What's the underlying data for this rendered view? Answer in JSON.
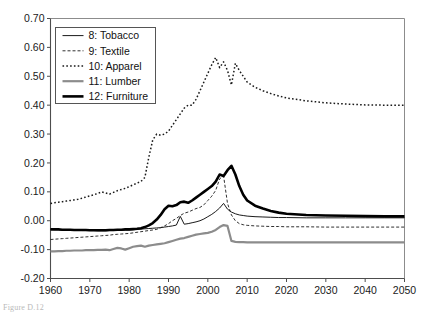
{
  "caption": "Figure D.12",
  "chart_data": {
    "type": "line",
    "title": "",
    "subtitle": "",
    "xlabel": "",
    "ylabel": "",
    "xlim": [
      1960,
      2050
    ],
    "ylim": [
      -0.2,
      0.7
    ],
    "grid": false,
    "legend_position": "top-left",
    "x_ticks": [
      1960,
      1970,
      1980,
      1990,
      2000,
      2010,
      2020,
      2030,
      2040,
      2050
    ],
    "x_tick_labels": [
      "1960",
      "1970",
      "1980",
      "1990",
      "2000",
      "2010",
      "2020",
      "2030",
      "2040",
      "2050"
    ],
    "y_ticks": [
      -0.2,
      -0.1,
      0.0,
      0.1,
      0.2,
      0.3,
      0.4,
      0.5,
      0.6,
      0.7
    ],
    "y_tick_labels": [
      "-0.20",
      "-0.10",
      "0.00",
      "0.10",
      "0.20",
      "0.30",
      "0.40",
      "0.50",
      "0.60",
      "0.70"
    ],
    "x": [
      1960,
      1961,
      1962,
      1963,
      1964,
      1965,
      1966,
      1967,
      1968,
      1969,
      1970,
      1971,
      1972,
      1973,
      1974,
      1975,
      1976,
      1977,
      1978,
      1979,
      1980,
      1981,
      1982,
      1983,
      1984,
      1985,
      1986,
      1987,
      1988,
      1989,
      1990,
      1991,
      1992,
      1993,
      1994,
      1995,
      1996,
      1997,
      1998,
      1999,
      2000,
      2001,
      2002,
      2003,
      2004,
      2005,
      2006,
      2007,
      2008,
      2009,
      2010,
      2012,
      2014,
      2016,
      2018,
      2020,
      2025,
      2030,
      2035,
      2040,
      2045,
      2050
    ],
    "series": [
      {
        "name": "8: Tobacco",
        "key": "tobacco",
        "style": "solid-thin",
        "color": "#1a1a1a",
        "width": 1.0,
        "dash": "",
        "values": [
          -0.03,
          -0.031,
          -0.031,
          -0.032,
          -0.032,
          -0.033,
          -0.033,
          -0.033,
          -0.034,
          -0.034,
          -0.034,
          -0.034,
          -0.035,
          -0.035,
          -0.035,
          -0.034,
          -0.034,
          -0.033,
          -0.033,
          -0.032,
          -0.032,
          -0.031,
          -0.03,
          -0.029,
          -0.028,
          -0.027,
          -0.026,
          -0.025,
          -0.024,
          -0.022,
          -0.02,
          -0.018,
          -0.015,
          0.015,
          -0.012,
          -0.01,
          -0.007,
          -0.004,
          0.0,
          0.006,
          0.014,
          0.022,
          0.032,
          0.044,
          0.06,
          0.04,
          0.03,
          0.024,
          0.02,
          0.018,
          0.016,
          0.014,
          0.013,
          0.012,
          0.011,
          0.011,
          0.01,
          0.01,
          0.01,
          0.01,
          0.01,
          0.01
        ]
      },
      {
        "name": "9: Textile",
        "key": "textile",
        "style": "dashed-thin",
        "color": "#1a1a1a",
        "width": 0.9,
        "dash": "3,2",
        "values": [
          -0.065,
          -0.064,
          -0.063,
          -0.062,
          -0.061,
          -0.06,
          -0.059,
          -0.058,
          -0.057,
          -0.056,
          -0.055,
          -0.054,
          -0.053,
          -0.052,
          -0.051,
          -0.05,
          -0.048,
          -0.047,
          -0.046,
          -0.045,
          -0.044,
          -0.042,
          -0.04,
          -0.038,
          -0.036,
          -0.034,
          -0.032,
          -0.03,
          -0.024,
          -0.018,
          -0.01,
          0.0,
          0.008,
          0.018,
          0.026,
          0.03,
          0.036,
          0.042,
          0.046,
          0.055,
          0.07,
          0.085,
          0.105,
          0.145,
          0.155,
          0.06,
          0.02,
          0.0,
          -0.01,
          -0.014,
          -0.016,
          -0.018,
          -0.019,
          -0.02,
          -0.02,
          -0.021,
          -0.021,
          -0.022,
          -0.022,
          -0.022,
          -0.022,
          -0.022
        ]
      },
      {
        "name": "10: Apparel",
        "key": "apparel",
        "style": "dotted",
        "color": "#1a1a1a",
        "width": 1.5,
        "dash": "1.6,2.2",
        "values": [
          0.06,
          0.062,
          0.064,
          0.066,
          0.068,
          0.07,
          0.072,
          0.074,
          0.078,
          0.082,
          0.086,
          0.09,
          0.094,
          0.1,
          0.096,
          0.092,
          0.098,
          0.104,
          0.108,
          0.112,
          0.118,
          0.124,
          0.13,
          0.136,
          0.15,
          0.22,
          0.28,
          0.3,
          0.296,
          0.3,
          0.31,
          0.33,
          0.35,
          0.37,
          0.39,
          0.4,
          0.4,
          0.42,
          0.45,
          0.48,
          0.51,
          0.54,
          0.565,
          0.53,
          0.55,
          0.52,
          0.47,
          0.545,
          0.52,
          0.5,
          0.48,
          0.462,
          0.45,
          0.44,
          0.432,
          0.425,
          0.415,
          0.408,
          0.404,
          0.401,
          0.4,
          0.4
        ]
      },
      {
        "name": "11: Lumber",
        "key": "lumber",
        "style": "solid-gray",
        "color": "#8c8c8c",
        "width": 2.2,
        "dash": "",
        "values": [
          -0.106,
          -0.106,
          -0.105,
          -0.105,
          -0.104,
          -0.104,
          -0.103,
          -0.103,
          -0.103,
          -0.102,
          -0.102,
          -0.102,
          -0.101,
          -0.101,
          -0.1,
          -0.102,
          -0.098,
          -0.094,
          -0.096,
          -0.1,
          -0.095,
          -0.09,
          -0.088,
          -0.086,
          -0.09,
          -0.086,
          -0.084,
          -0.082,
          -0.08,
          -0.078,
          -0.074,
          -0.07,
          -0.066,
          -0.062,
          -0.06,
          -0.056,
          -0.052,
          -0.048,
          -0.046,
          -0.044,
          -0.042,
          -0.038,
          -0.032,
          -0.022,
          -0.015,
          -0.018,
          -0.07,
          -0.073,
          -0.074,
          -0.074,
          -0.075,
          -0.075,
          -0.075,
          -0.075,
          -0.075,
          -0.075,
          -0.075,
          -0.075,
          -0.075,
          -0.075,
          -0.075,
          -0.075
        ]
      },
      {
        "name": "12: Furniture",
        "key": "furniture",
        "style": "solid-thick",
        "color": "#000000",
        "width": 2.6,
        "dash": "",
        "values": [
          -0.03,
          -0.03,
          -0.03,
          -0.031,
          -0.031,
          -0.031,
          -0.032,
          -0.032,
          -0.032,
          -0.032,
          -0.033,
          -0.033,
          -0.033,
          -0.033,
          -0.033,
          -0.032,
          -0.032,
          -0.031,
          -0.031,
          -0.03,
          -0.03,
          -0.029,
          -0.028,
          -0.026,
          -0.022,
          -0.016,
          -0.008,
          0.004,
          0.02,
          0.04,
          0.052,
          0.05,
          0.054,
          0.064,
          0.066,
          0.062,
          0.07,
          0.08,
          0.09,
          0.1,
          0.11,
          0.12,
          0.135,
          0.16,
          0.155,
          0.175,
          0.19,
          0.16,
          0.12,
          0.09,
          0.07,
          0.052,
          0.042,
          0.034,
          0.028,
          0.024,
          0.02,
          0.018,
          0.017,
          0.016,
          0.015,
          0.015
        ]
      }
    ]
  }
}
